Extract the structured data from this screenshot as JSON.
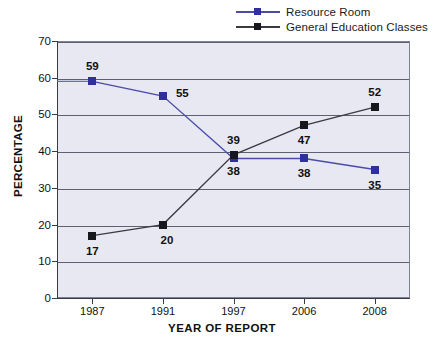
{
  "chart_data": {
    "type": "line",
    "title": "",
    "xlabel": "YEAR OF REPORT",
    "ylabel": "PERCENTAGE",
    "categories": [
      "1987",
      "1991",
      "1997",
      "2006",
      "2008"
    ],
    "ylim": [
      0,
      70
    ],
    "yticks": [
      "0",
      "10",
      "20",
      "30",
      "40",
      "50",
      "60",
      "70"
    ],
    "grid": true,
    "legend_position": "top-right",
    "series": [
      {
        "name": "Resource Room",
        "color": "#2f2f9e",
        "values": [
          59,
          55,
          38,
          38,
          35
        ],
        "labels": [
          "59",
          "55",
          "38",
          "38",
          "35"
        ]
      },
      {
        "name": "General Education Classes",
        "color": "#17171c",
        "values": [
          17,
          20,
          39,
          47,
          52
        ],
        "labels": [
          "17",
          "20",
          "39",
          "47",
          "52"
        ]
      }
    ]
  },
  "legend": {
    "items": [
      {
        "label": "Resource Room",
        "marker": "square-marker-blue"
      },
      {
        "label": "General Education Classes",
        "marker": "square-marker-black"
      }
    ]
  },
  "axes": {
    "x_title": "YEAR OF REPORT",
    "y_title": "PERCENTAGE"
  }
}
